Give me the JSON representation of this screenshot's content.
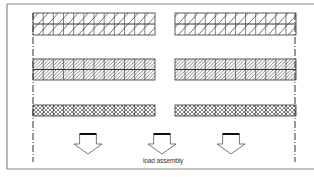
{
  "diagram": {
    "caption": "load assembly",
    "colors": {
      "line": "#333333",
      "frame": "#888888",
      "background": "#ffffff"
    },
    "frame": {
      "top": 4,
      "left": 7,
      "bottom": 169
    },
    "axes": [
      {
        "name": "left-centerline",
        "x": 33,
        "y1": 13,
        "y2": 162
      },
      {
        "name": "right-centerline",
        "x": 295,
        "y1": 13,
        "y2": 162
      }
    ],
    "layers": [
      {
        "name": "top-layer",
        "pattern": "diagonal-sparse",
        "y": 13,
        "height": 22,
        "rows": 2,
        "cells_per_segment": 12
      },
      {
        "name": "middle-layer",
        "pattern": "diagonal-dense",
        "y": 59,
        "height": 21,
        "rows": 2,
        "cells_per_segment": 12
      },
      {
        "name": "bottom-layer",
        "pattern": "crosshatch",
        "y": 105,
        "height": 11,
        "rows": 1,
        "cells_per_segment": 12
      }
    ],
    "segments": [
      {
        "x": 33,
        "width": 122
      },
      {
        "x": 175,
        "width": 121
      }
    ],
    "arrows": [
      {
        "name": "load-arrow-1",
        "x": 74,
        "y": 134,
        "width": 28,
        "height": 20
      },
      {
        "name": "load-arrow-2",
        "x": 148,
        "y": 134,
        "width": 28,
        "height": 20
      },
      {
        "name": "load-arrow-3",
        "x": 217,
        "y": 134,
        "width": 28,
        "height": 20
      }
    ],
    "caption_pos": {
      "x": 143,
      "y": 157
    }
  }
}
